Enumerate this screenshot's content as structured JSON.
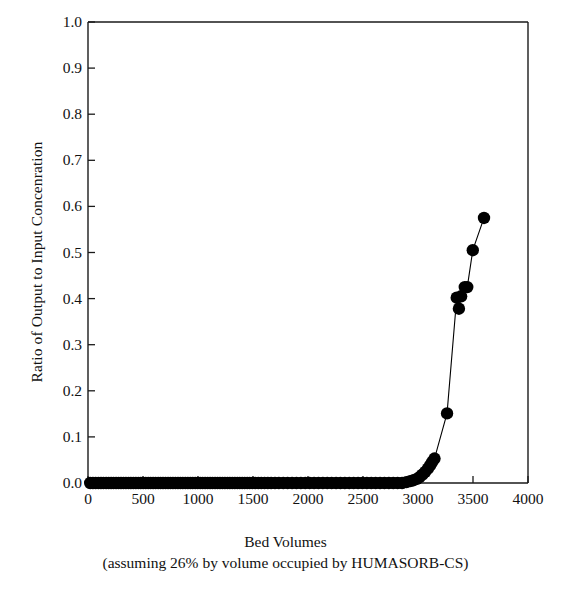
{
  "chart_data": {
    "type": "scatter",
    "title": "",
    "subtitle": "",
    "xlabel": "Bed Volumes",
    "xlabel_line2": "(assuming 26% by volume occupied by HUMASORB-CS)",
    "ylabel": "Ratio of Output to Input Concenration",
    "xlim": [
      0,
      4000
    ],
    "ylim": [
      0,
      1.0
    ],
    "xticks": [
      0,
      500,
      1000,
      1500,
      2000,
      2500,
      3000,
      3500,
      4000
    ],
    "xtick_labels": [
      "0",
      "500",
      "1000",
      "1500",
      "2000",
      "2500",
      "3000",
      "3500",
      "4000"
    ],
    "yticks": [
      0.0,
      0.1,
      0.2,
      0.3,
      0.4,
      0.5,
      0.6,
      0.7,
      0.8,
      0.9,
      1.0
    ],
    "ytick_labels": [
      "0.0",
      "0.1",
      "0.2",
      "0.3",
      "0.4",
      "0.5",
      "0.6",
      "0.7",
      "0.8",
      "0.9",
      "1.0"
    ],
    "grid": false,
    "legend": null,
    "marker": "filled-circle",
    "marker_color": "#000000",
    "line_color": "#000000",
    "series": [
      {
        "name": "Breakthrough curve",
        "x": [
          20,
          45,
          70,
          95,
          118,
          140,
          165,
          188,
          210,
          232,
          255,
          278,
          300,
          322,
          345,
          368,
          390,
          412,
          435,
          458,
          480,
          502,
          525,
          548,
          570,
          592,
          615,
          638,
          660,
          682,
          705,
          728,
          750,
          772,
          795,
          818,
          840,
          862,
          885,
          908,
          930,
          952,
          975,
          998,
          1020,
          1042,
          1065,
          1088,
          1110,
          1132,
          1155,
          1178,
          1200,
          1222,
          1245,
          1268,
          1290,
          1312,
          1335,
          1358,
          1380,
          1402,
          1425,
          1448,
          1470,
          1495,
          1520,
          1548,
          1575,
          1605,
          1635,
          1665,
          1700,
          1735,
          1775,
          1815,
          1855,
          1895,
          1935,
          1975,
          2015,
          2055,
          2095,
          2135,
          2175,
          2215,
          2255,
          2295,
          2335,
          2375,
          2415,
          2455,
          2495,
          2535,
          2575,
          2615,
          2655,
          2695,
          2735,
          2775,
          2815,
          2855,
          2895,
          2930,
          2960,
          2990,
          3015,
          3040,
          3065,
          3090,
          3110,
          3130,
          3150,
          3264,
          3352,
          3372,
          3392,
          3425,
          3448,
          3498,
          3600
        ],
        "y": [
          0.0,
          0.0,
          0.0,
          0.0,
          0.0,
          0.0,
          0.0,
          0.0,
          0.0,
          0.0,
          0.0,
          0.0,
          0.0,
          0.0,
          0.0,
          0.0,
          0.0,
          0.0,
          0.0,
          0.0,
          0.0,
          0.0,
          0.0,
          0.0,
          0.0,
          0.0,
          0.0,
          0.0,
          0.0,
          0.0,
          0.0,
          0.0,
          0.0,
          0.0,
          0.0,
          0.0,
          0.0,
          0.0,
          0.0,
          0.0,
          0.0,
          0.0,
          0.0,
          0.0,
          0.0,
          0.0,
          0.0,
          0.0,
          0.0,
          0.0,
          0.0,
          0.0,
          0.0,
          0.0,
          0.0,
          0.0,
          0.0,
          0.0,
          0.0,
          0.0,
          0.0,
          0.0,
          0.0,
          0.0,
          0.0,
          0.0,
          0.0,
          0.0,
          0.0,
          0.0,
          0.0,
          0.0,
          0.0,
          0.0,
          0.0,
          0.0,
          0.0,
          0.0,
          0.0,
          0.0,
          0.0,
          0.0,
          0.0,
          0.0,
          0.0,
          0.0,
          0.0,
          0.0,
          0.0,
          0.0,
          0.0,
          0.0,
          0.0,
          0.0,
          0.0,
          0.0,
          0.0,
          0.0,
          0.0,
          0.0,
          0.0,
          0.0,
          0.002,
          0.004,
          0.006,
          0.009,
          0.013,
          0.018,
          0.024,
          0.031,
          0.038,
          0.046,
          0.053,
          0.151,
          0.402,
          0.378,
          0.405,
          0.425,
          0.425,
          0.505,
          0.575
        ],
        "y_last": 0.693
      }
    ],
    "notable_points": [
      {
        "x": 3150,
        "y": 0.053
      },
      {
        "x": 3264,
        "y": 0.151
      },
      {
        "x": 3352,
        "y": 0.402
      },
      {
        "x": 3372,
        "y": 0.378
      },
      {
        "x": 3425,
        "y": 0.425
      },
      {
        "x": 3448,
        "y": 0.425
      },
      {
        "x": 3498,
        "y": 0.505
      },
      {
        "x": 3540,
        "y": 0.575
      },
      {
        "x": 3600,
        "y": 0.693
      }
    ]
  },
  "axes": {
    "plot_left_px": 88,
    "plot_right_px": 528,
    "plot_top_px": 22,
    "plot_bottom_px": 483,
    "frame_color": "#1a1a1a"
  }
}
